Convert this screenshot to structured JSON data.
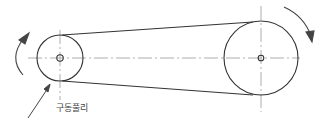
{
  "diagram": {
    "type": "belt-drive",
    "label_driving_pulley": "구동풀리",
    "small_pulley": {
      "cx": 60,
      "cy": 58,
      "r": 23,
      "hub_r": 3
    },
    "large_pulley": {
      "cx": 261,
      "cy": 58,
      "r": 37,
      "hub_r": 3
    },
    "line_color": "#333333",
    "centerline_color": "#888888"
  }
}
